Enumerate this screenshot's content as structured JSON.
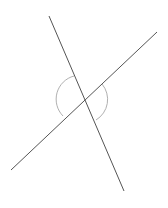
{
  "diagram": {
    "type": "intersecting-lines-with-vertical-angle-arcs",
    "background": "#ffffff",
    "lines": [
      {
        "name": "steep-line",
        "x1": 49,
        "y1": 16,
        "x2": 124,
        "y2": 191,
        "color": "#555555",
        "width": 1
      },
      {
        "name": "shallow-line",
        "x1": 11,
        "y1": 170,
        "x2": 157,
        "y2": 32,
        "color": "#555555",
        "width": 1
      }
    ],
    "intersection": {
      "x": 85,
      "y": 99
    },
    "arcs": [
      {
        "name": "left-angle-arc",
        "d": "M 74 76 A 24 24 0 0 0 63 116",
        "color": "#b0b0b0"
      },
      {
        "name": "right-angle-arc",
        "d": "M 102 84 A 24 24 0 0 1 96 120",
        "color": "#b0b0b0"
      }
    ]
  }
}
